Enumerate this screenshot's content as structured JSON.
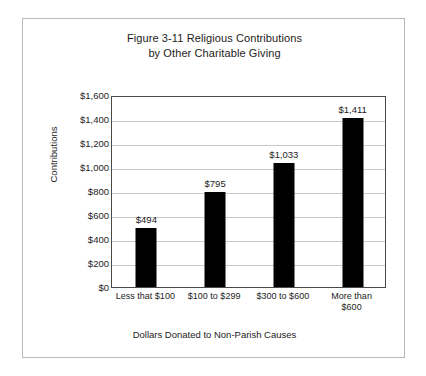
{
  "chart_data": {
    "type": "bar",
    "title": "Figure 3-11 Religious Contributions by Other Charitable Giving",
    "title_lines": [
      "Figure 3-11 Religious Contributions",
      "by Other Charitable Giving"
    ],
    "xlabel": "Dollars Donated to Non-Parish Causes",
    "ylabel": "Contributions",
    "categories": [
      "Less that $100",
      "$100 to $299",
      "$300 to $600",
      "More than $600"
    ],
    "category_lines": [
      [
        "Less that $100"
      ],
      [
        "$100 to $299"
      ],
      [
        "$300 to $600"
      ],
      [
        "More than",
        "$600"
      ]
    ],
    "values": [
      494,
      795,
      1033,
      1411
    ],
    "value_labels": [
      "$494",
      "$795",
      "$1,033",
      "$1,411"
    ],
    "ylim": [
      0,
      1600
    ],
    "ytick_values": [
      0,
      200,
      400,
      600,
      800,
      1000,
      1200,
      1400,
      1600
    ],
    "ytick_labels": [
      "$0",
      "$200",
      "$400",
      "$600",
      "$800",
      "$1,000",
      "$1,200",
      "$1,400",
      "$1,600"
    ],
    "grid": true,
    "grid_axis": "y",
    "legend": false,
    "bar_color": "#000000",
    "grid_color": "#c9c9c9",
    "plot_border_color": "#4a4a4a",
    "frame_color": "#b9b9b9",
    "background_color": "#ffffff",
    "text_color": "#1c1c1c"
  }
}
